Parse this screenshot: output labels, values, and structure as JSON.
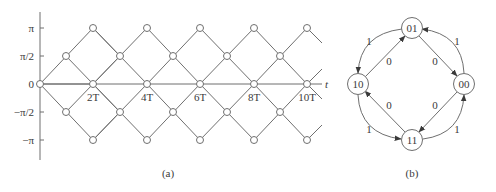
{
  "panel_a": {
    "caption": "(a)",
    "axis_x_label": "t",
    "y_ticks": [
      {
        "label": "π",
        "value": 3.14159
      },
      {
        "label": "π/2",
        "value": 1.5708
      },
      {
        "label": "0",
        "value": 0
      },
      {
        "label": "−π/2",
        "value": -1.5708
      },
      {
        "label": "−π",
        "value": -3.14159
      }
    ],
    "x_ticks": [
      {
        "label": "2T",
        "value": 2
      },
      {
        "label": "4T",
        "value": 4
      },
      {
        "label": "6T",
        "value": 6
      },
      {
        "label": "8T",
        "value": 8
      },
      {
        "label": "10T",
        "value": 10
      }
    ],
    "description": "Phase trellis: phase changes by ±π/2 each symbol interval T"
  },
  "panel_b": {
    "caption": "(b)",
    "states": [
      {
        "id": "01",
        "label": "01"
      },
      {
        "id": "00",
        "label": "00"
      },
      {
        "id": "11",
        "label": "11"
      },
      {
        "id": "10",
        "label": "10"
      }
    ],
    "transitions": [
      {
        "from": "10",
        "to": "01",
        "label": "0"
      },
      {
        "from": "01",
        "to": "00",
        "label": "0"
      },
      {
        "from": "00",
        "to": "11",
        "label": "0"
      },
      {
        "from": "11",
        "to": "10",
        "label": "0"
      },
      {
        "from": "01",
        "to": "10",
        "label": "1"
      },
      {
        "from": "00",
        "to": "01",
        "label": "1"
      },
      {
        "from": "10",
        "to": "11",
        "label": "1"
      },
      {
        "from": "11",
        "to": "00",
        "label": "1"
      }
    ]
  }
}
